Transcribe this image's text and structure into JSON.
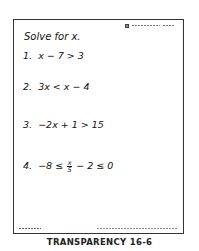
{
  "document": {
    "header_note": "© Holt, Rinehart and Winston",
    "title": "Solve for x.",
    "problems": [
      {
        "number": "1.",
        "expression": "x − 7 > 3"
      },
      {
        "number": "2.",
        "expression": "3x < x − 4"
      },
      {
        "number": "3.",
        "expression": "−2x + 1 > 15"
      },
      {
        "number": "4.",
        "prefix": "−8 ≤",
        "frac_num": "x",
        "frac_den": "5",
        "suffix": "− 2 ≤ 0"
      }
    ],
    "footer_left": "TRANSPARENCY 16-6",
    "footer_right": "To be used with ALGEBRA"
  },
  "caption": "TRANSPARENCY 16-6"
}
